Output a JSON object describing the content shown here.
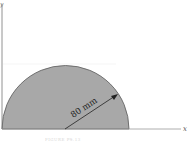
{
  "figure": {
    "axes": {
      "x_label": "x",
      "y_label": "y"
    },
    "shape": {
      "type": "semicircle",
      "fill": "#a8a8a8",
      "stroke": "#555555"
    },
    "dimension": {
      "label": "80 mm",
      "kind": "radius"
    },
    "caption": "FIGURE P9.13"
  }
}
